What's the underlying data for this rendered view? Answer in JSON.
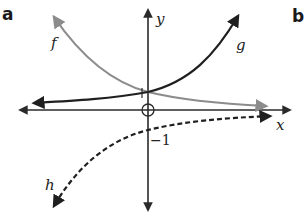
{
  "panels": {
    "left_label": "a",
    "right_label": "b"
  },
  "axes": {
    "x_label": "x",
    "y_label": "y",
    "y_intercept_positive_label": "1",
    "y_intercept_negative_label": "−1"
  },
  "curves": [
    {
      "name": "f",
      "label": "f",
      "style": "solid",
      "color": "#1f1f1f",
      "description": "increasing exponential through (0,1)"
    },
    {
      "name": "g",
      "label": "g",
      "style": "solid",
      "color": "#8c8c8c",
      "description": "decreasing exponential through (0,1)"
    },
    {
      "name": "h",
      "label": "h",
      "style": "dashed",
      "color": "#1f1f1f",
      "description": "reflected exponential through (0,-1)"
    }
  ],
  "colors": {
    "axis": "#2a2a2a",
    "f": "#1f1f1f",
    "g": "#8c8c8c",
    "h": "#1f1f1f"
  }
}
